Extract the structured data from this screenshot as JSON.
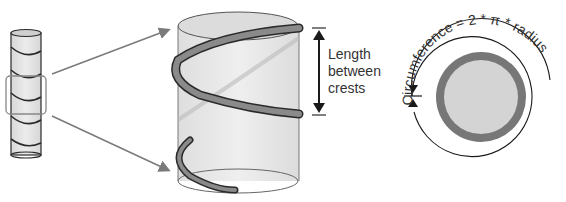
{
  "diagram": {
    "labels": {
      "length_line1": "Length",
      "length_line2": "between",
      "length_line3": "crests",
      "circumference": "Circumference = 2 * π * radius"
    },
    "colors": {
      "cylinder_fill": "#e6e6e6",
      "coil": "#8a8a8a",
      "outline": "#2a2a2a",
      "arrow": "#7a7a7a",
      "ring": "#777777",
      "disk": "#d4d4d4"
    }
  }
}
